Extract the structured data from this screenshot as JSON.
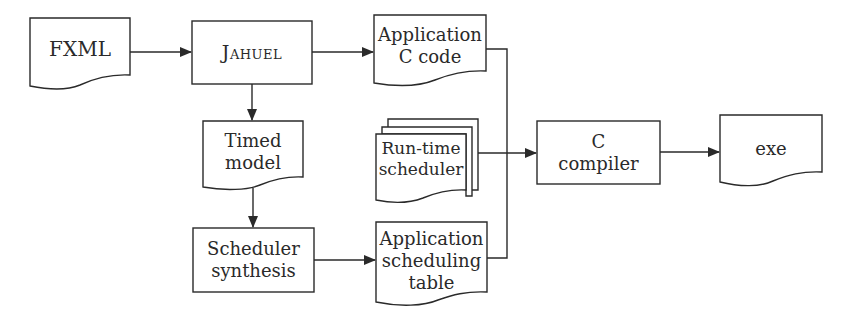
{
  "diagram": {
    "type": "flowchart",
    "nodes": {
      "fxml": {
        "label": "FXML",
        "shape": "document"
      },
      "jahuel": {
        "label": "Jahuel",
        "shape": "process"
      },
      "app_c_code": {
        "line1": "Application",
        "line2": "C code",
        "shape": "document"
      },
      "timed_model": {
        "line1": "Timed",
        "line2": "model",
        "shape": "document"
      },
      "runtime_scheduler": {
        "line1": "Run-time",
        "line2": "scheduler",
        "shape": "multi-document"
      },
      "c_compiler": {
        "line1": "C",
        "line2": "compiler",
        "shape": "process"
      },
      "exe": {
        "label": "exe",
        "shape": "document"
      },
      "scheduler_synthesis": {
        "line1": "Scheduler",
        "line2": "synthesis",
        "shape": "process"
      },
      "app_sched_table": {
        "line1": "Application",
        "line2": "scheduling",
        "line3": "table",
        "shape": "document"
      }
    },
    "edges": [
      {
        "from": "FXML",
        "to": "Jahuel"
      },
      {
        "from": "Jahuel",
        "to": "Application C code"
      },
      {
        "from": "Jahuel",
        "to": "Timed model"
      },
      {
        "from": "Timed model",
        "to": "Scheduler synthesis"
      },
      {
        "from": "Scheduler synthesis",
        "to": "Application scheduling table"
      },
      {
        "from": "Application C code",
        "to": "C compiler"
      },
      {
        "from": "Run-time scheduler",
        "to": "C compiler"
      },
      {
        "from": "Application scheduling table",
        "to": "C compiler"
      },
      {
        "from": "C compiler",
        "to": "exe"
      }
    ],
    "colors": {
      "stroke": "#2a2a2a",
      "background": "#ffffff",
      "text": "#2a2a2a"
    }
  }
}
